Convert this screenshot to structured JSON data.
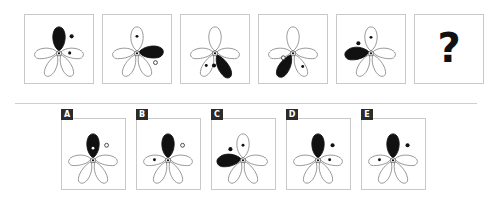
{
  "puzzle": {
    "type": "visual-analogy-matrix",
    "prompt_symbol": "?",
    "divider": true,
    "stroke_color": "#8a8a8a",
    "fill_color": "#111111",
    "panel_border_color": "#c9c9c9",
    "badge_background": "#2b2b2b",
    "badge_text_color": "#ffffff"
  },
  "sequence": {
    "label": "sequence-row",
    "panels": [
      {
        "id": "seq-1",
        "black_petal": "top",
        "marks": [
          {
            "kind": "filled-dot",
            "where": "outside-right-of-top-petal"
          },
          {
            "kind": "filled-dot",
            "where": "inside-right-petal"
          }
        ]
      },
      {
        "id": "seq-2",
        "black_petal": "upper-right",
        "marks": [
          {
            "kind": "filled-dot",
            "where": "inside-top-petal"
          },
          {
            "kind": "hollow-dot",
            "where": "outside-lower-right"
          }
        ]
      },
      {
        "id": "seq-3",
        "black_petal": "lower-right",
        "marks": [
          {
            "kind": "filled-dot",
            "where": "inside-lower-left-petal"
          },
          {
            "kind": "filled-dot",
            "where": "between-lower-petals"
          }
        ]
      },
      {
        "id": "seq-4",
        "black_petal": "lower-left",
        "marks": [
          {
            "kind": "hollow-dot",
            "where": "left-of-center"
          },
          {
            "kind": "filled-dot",
            "where": "inside-lower-right-petal"
          }
        ]
      },
      {
        "id": "seq-5",
        "black_petal": "upper-left",
        "marks": [
          {
            "kind": "filled-dot",
            "where": "outside-upper-left"
          },
          {
            "kind": "filled-dot",
            "where": "inside-top-petal"
          }
        ]
      },
      {
        "id": "seq-6",
        "black_petal": "none",
        "question": "?"
      }
    ]
  },
  "options": {
    "label": "answer-options-row",
    "items": [
      {
        "letter": "A",
        "black_petal": "top",
        "marks": [
          {
            "kind": "white-dot",
            "where": "inside-black-top-petal"
          },
          {
            "kind": "hollow-dot",
            "where": "outside-right-of-top-petal"
          }
        ]
      },
      {
        "letter": "B",
        "black_petal": "top",
        "marks": [
          {
            "kind": "hollow-dot",
            "where": "outside-right-of-top-petal"
          },
          {
            "kind": "filled-dot",
            "where": "inside-left-petal"
          }
        ]
      },
      {
        "letter": "C",
        "black_petal": "upper-left",
        "marks": [
          {
            "kind": "filled-dot",
            "where": "outside-upper-left"
          },
          {
            "kind": "filled-dot",
            "where": "inside-top-petal"
          }
        ]
      },
      {
        "letter": "D",
        "black_petal": "top",
        "marks": [
          {
            "kind": "filled-dot",
            "where": "outside-right-of-top-petal"
          },
          {
            "kind": "filled-dot",
            "where": "inside-right-petal"
          }
        ]
      },
      {
        "letter": "E",
        "black_petal": "top",
        "marks": [
          {
            "kind": "filled-dot",
            "where": "outside-right-of-top-petal"
          },
          {
            "kind": "filled-dot",
            "where": "inside-left-petal"
          }
        ]
      }
    ]
  }
}
